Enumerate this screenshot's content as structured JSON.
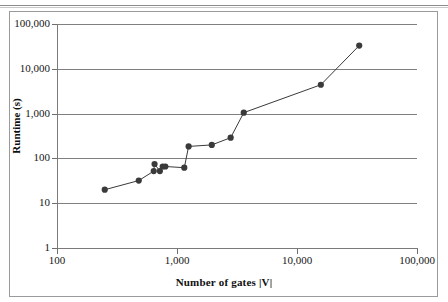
{
  "chart_data": {
    "type": "line",
    "title": "",
    "xlabel": "Number of gates |V|",
    "ylabel": "Runtime (s)",
    "xscale": "log",
    "yscale": "log",
    "xlim": [
      100,
      100000
    ],
    "ylim": [
      1,
      100000
    ],
    "grid": "horizontal",
    "legend": "none",
    "marker": "filled-circle",
    "series_color": "#3a3a3a",
    "xticks": [
      "100",
      "1,000",
      "10,000",
      "100,000"
    ],
    "xtick_values": [
      100,
      1000,
      10000,
      100000
    ],
    "yticks": [
      "1",
      "10",
      "100",
      "1,000",
      "10,000",
      "100,000"
    ],
    "ytick_values": [
      1,
      10,
      100,
      1000,
      10000,
      100000
    ],
    "series": [
      {
        "name": "Runtime",
        "points": [
          {
            "x": 250,
            "y": 20
          },
          {
            "x": 480,
            "y": 32
          },
          {
            "x": 640,
            "y": 52
          },
          {
            "x": 650,
            "y": 75
          },
          {
            "x": 720,
            "y": 52
          },
          {
            "x": 760,
            "y": 66
          },
          {
            "x": 800,
            "y": 66
          },
          {
            "x": 1150,
            "y": 62
          },
          {
            "x": 1250,
            "y": 185
          },
          {
            "x": 1950,
            "y": 200
          },
          {
            "x": 2800,
            "y": 290
          },
          {
            "x": 3600,
            "y": 1050
          },
          {
            "x": 15800,
            "y": 4400
          },
          {
            "x": 33000,
            "y": 33000
          }
        ]
      }
    ]
  }
}
